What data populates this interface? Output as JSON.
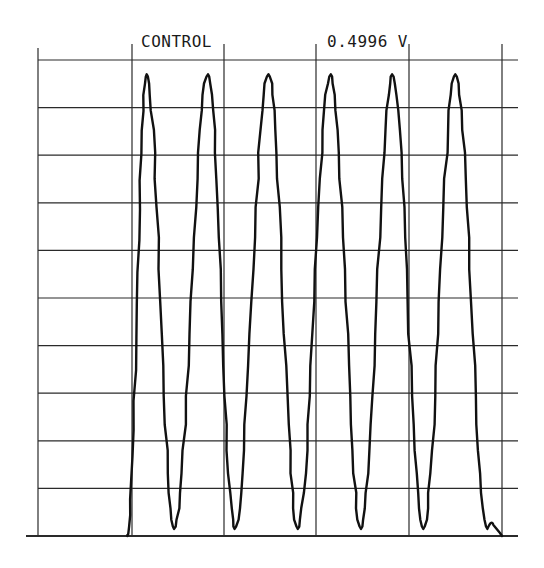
{
  "header": {
    "title": "CONTROL",
    "value": "0.4996",
    "unit": "V"
  },
  "colors": {
    "background": "#ffffff",
    "grid": "#2a2a2a",
    "trace": "#111111"
  },
  "chart_data": {
    "type": "line",
    "title": "CONTROL",
    "annotations": [
      "0.4996 V"
    ],
    "xlabel": "",
    "ylabel": "",
    "grid": true,
    "grid_divisions": {
      "x": 5,
      "y": 10
    },
    "legend": "none",
    "amplitude_label_volts": 0.4996,
    "cycles": 6,
    "x_unit": "divisions",
    "y_unit": "divisions",
    "xlim": [
      0,
      5
    ],
    "ylim": [
      0,
      10
    ],
    "peaks": [
      {
        "x": 0.16,
        "y": 9.7
      },
      {
        "x": 0.83,
        "y": 9.7
      },
      {
        "x": 1.49,
        "y": 9.7
      },
      {
        "x": 2.17,
        "y": 9.7
      },
      {
        "x": 2.84,
        "y": 9.7
      },
      {
        "x": 3.53,
        "y": 9.7
      }
    ],
    "troughs": [
      {
        "x": -0.05,
        "y": 0.0
      },
      {
        "x": 0.46,
        "y": 0.15
      },
      {
        "x": 1.12,
        "y": 0.15
      },
      {
        "x": 1.81,
        "y": 0.15
      },
      {
        "x": 2.5,
        "y": 0.15
      },
      {
        "x": 3.18,
        "y": 0.15
      },
      {
        "x": 3.88,
        "y": 0.15
      }
    ]
  }
}
